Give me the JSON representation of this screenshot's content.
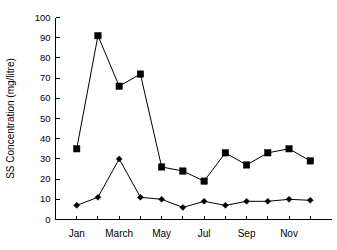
{
  "chart_data": {
    "type": "line",
    "title": "",
    "xlabel": "",
    "ylabel": "SS Concentration (mg/litre)",
    "ylim": [
      0,
      100
    ],
    "ytick_labels": [
      "0",
      "10",
      "20",
      "30",
      "40",
      "50",
      "60",
      "70",
      "80",
      "90",
      "100"
    ],
    "ytick_values": [
      0,
      10,
      20,
      30,
      40,
      50,
      60,
      70,
      80,
      90,
      100
    ],
    "categories": [
      "Jan",
      "Feb",
      "March",
      "April",
      "May",
      "June",
      "Jul",
      "Aug",
      "Sep",
      "Oct",
      "Nov",
      "Dec"
    ],
    "xtick_labels_shown": [
      "Jan",
      "March",
      "May",
      "Jul",
      "Sep",
      "Nov"
    ],
    "xtick_label_indices": [
      0,
      2,
      4,
      6,
      8,
      10
    ],
    "grid": false,
    "legend": false,
    "legend_position": "none",
    "series": [
      {
        "name": "square-series",
        "marker": "square",
        "color": "#000000",
        "values": [
          35,
          91,
          66,
          72,
          26,
          24,
          19,
          33,
          27,
          33,
          35,
          29
        ]
      },
      {
        "name": "diamond-series",
        "marker": "diamond",
        "color": "#000000",
        "values": [
          7,
          11,
          30,
          11,
          10,
          6,
          9,
          7,
          9,
          9,
          10,
          9.5
        ]
      }
    ]
  },
  "colors": {
    "background": "#ffffff",
    "foreground": "#000000"
  }
}
